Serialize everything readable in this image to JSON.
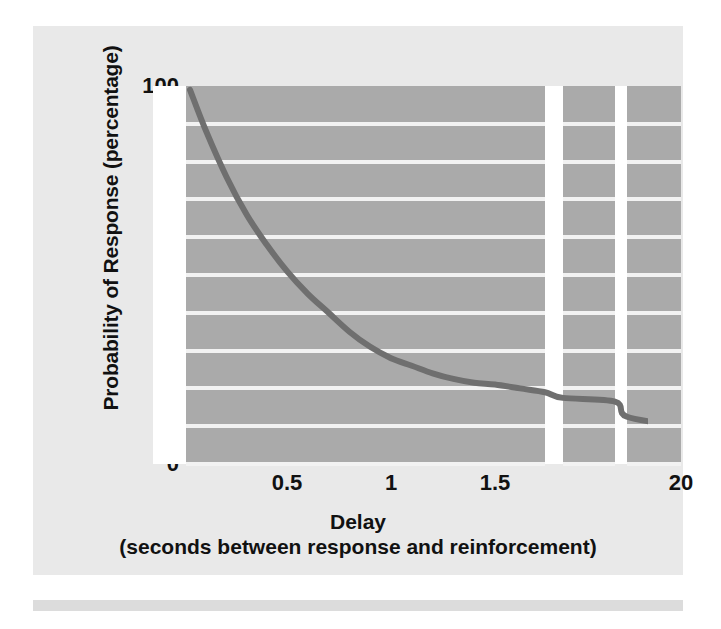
{
  "figure": {
    "panel_background": "#e9e9e9",
    "plot_background": "#aaaaaa",
    "gridline_color": "#f2f2f2",
    "curve_color": "#6f6f6f",
    "page_background": "#ffffff",
    "rule_color": "#dcdcdc"
  },
  "chart_data": {
    "type": "line",
    "title": "",
    "subtitle": "",
    "xlabel": "Delay",
    "xlabel_sub": "(seconds between response and reinforcement)",
    "ylabel": "Probability of Response (percentage)",
    "ylim": [
      0,
      100
    ],
    "ytick_labels": [
      "100",
      "90",
      "80",
      "70",
      "60",
      "50",
      "40",
      "30",
      "20",
      "10",
      "0"
    ],
    "yticks": [
      100,
      90,
      80,
      70,
      60,
      50,
      40,
      30,
      20,
      10,
      0
    ],
    "xtick_labels": [
      "0.5",
      "1",
      "1.5",
      "20"
    ],
    "xticks": [
      0.5,
      1,
      1.5,
      20
    ],
    "grid": "horizontal",
    "legend": "none",
    "axis_break": true,
    "axis_break_note": "x axis is broken twice after 1.7 s; final panel shows 20 s",
    "series": [
      {
        "name": "Probability of response",
        "x": [
          0.02,
          0.1,
          0.2,
          0.3,
          0.4,
          0.5,
          0.6,
          0.7,
          0.8,
          0.9,
          1.0,
          1.1,
          1.2,
          1.3,
          1.4,
          1.5,
          1.6,
          1.7,
          1.85,
          2.0,
          10,
          20
        ],
        "y": [
          99,
          88,
          76,
          66,
          58,
          51,
          45,
          40,
          35,
          31,
          28,
          26,
          24,
          22.5,
          21.5,
          21,
          20,
          19,
          17.5,
          16.5,
          12.5,
          10
        ]
      }
    ],
    "annotations": []
  },
  "axis": {
    "y_title": "Probability of Response (percentage)",
    "x_title": "Delay",
    "x_subtitle": "(seconds between response and reinforcement)"
  }
}
